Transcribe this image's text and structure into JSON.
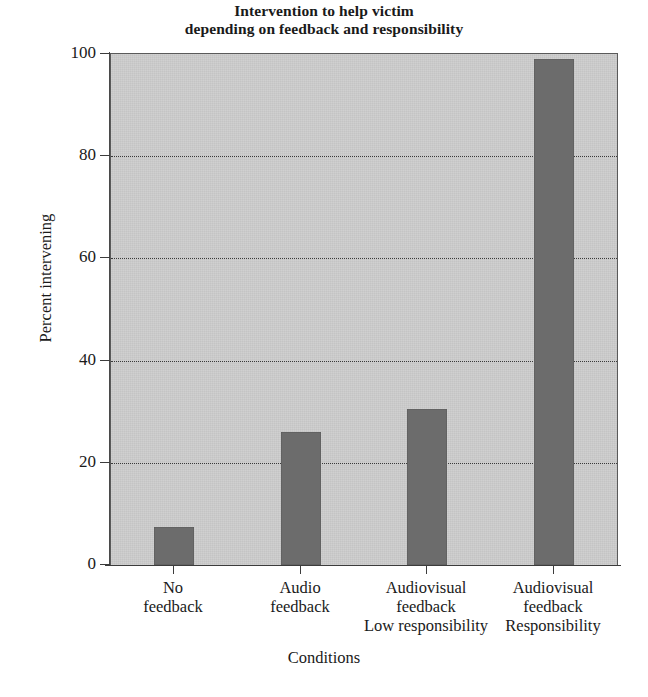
{
  "chart_data": {
    "type": "bar",
    "title": "Intervention to help victim depending on feedback and responsibility",
    "title_lines": [
      "Intervention to help victim",
      "depending on feedback and responsibility"
    ],
    "xlabel": "Conditions",
    "ylabel": "Percent intervening",
    "ylim": [
      0,
      100
    ],
    "yticks": [
      0,
      20,
      40,
      60,
      80,
      100
    ],
    "ytick_labels": [
      "0",
      "20",
      "40",
      "60",
      "80",
      "100"
    ],
    "grid": "horizontal-dotted",
    "legend": "none",
    "bar_color": "#6c6c6c",
    "plot_background": "#cccccc",
    "categories": [
      "No feedback",
      "Audio feedback",
      "Audiovisual feedback Low responsibility",
      "Audiovisual feedback Responsibility"
    ],
    "category_lines": [
      [
        "No",
        "feedback",
        ""
      ],
      [
        "Audio",
        "feedback",
        ""
      ],
      [
        "Audiovisual",
        "feedback",
        "Low responsibility"
      ],
      [
        "Audiovisual",
        "feedback",
        "Responsibility"
      ]
    ],
    "values": [
      7.5,
      26,
      30.5,
      99
    ]
  }
}
